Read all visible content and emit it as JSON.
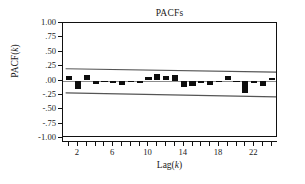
{
  "chart_data": {
    "type": "bar",
    "title": "PACFs",
    "xlabel": "Lag(k)",
    "ylabel": "PACF(k)",
    "grid": false,
    "legend": false,
    "ylim": [
      -1.0,
      1.0
    ],
    "xlim": [
      0.3,
      24.7
    ],
    "ytick_labels": [
      "1.00",
      ".75",
      ".50",
      ".25",
      ".00",
      "-.25",
      "-.50",
      "-.75",
      "-1.00"
    ],
    "ytick_values": [
      1.0,
      0.75,
      0.5,
      0.25,
      0.0,
      -0.25,
      -0.5,
      -0.75,
      -1.0
    ],
    "xtick_labels": [
      "2",
      "6",
      "10",
      "14",
      "18",
      "22"
    ],
    "xtick_values": [
      2,
      6,
      10,
      14,
      18,
      22
    ],
    "xtick_minor_values": [
      1,
      2,
      3,
      4,
      5,
      6,
      7,
      8,
      9,
      10,
      11,
      12,
      13,
      14,
      15,
      16,
      17,
      18,
      19,
      20,
      21,
      22,
      23,
      24
    ],
    "categories": [
      1,
      2,
      3,
      4,
      5,
      6,
      7,
      8,
      9,
      10,
      11,
      12,
      13,
      14,
      15,
      16,
      17,
      18,
      19,
      20,
      21,
      22,
      23,
      24
    ],
    "values": [
      0.08,
      -0.14,
      0.09,
      -0.06,
      -0.03,
      -0.05,
      -0.07,
      -0.02,
      -0.04,
      0.06,
      0.12,
      0.07,
      0.1,
      -0.12,
      -0.09,
      -0.04,
      -0.07,
      -0.02,
      0.07,
      -0.03,
      -0.22,
      -0.05,
      -0.09,
      0.04
    ],
    "confidence_bands": {
      "label": "95% confidence limits",
      "upper_start": 0.205,
      "upper_end": 0.145,
      "lower_start": -0.215,
      "lower_end": -0.285
    },
    "zero_line": 0.0,
    "series_color": "#0d0d0d",
    "axis_color": "#111111",
    "zero_line_color": "#8c8c8c",
    "ci_color": "#555555",
    "background": "#ffffff"
  }
}
